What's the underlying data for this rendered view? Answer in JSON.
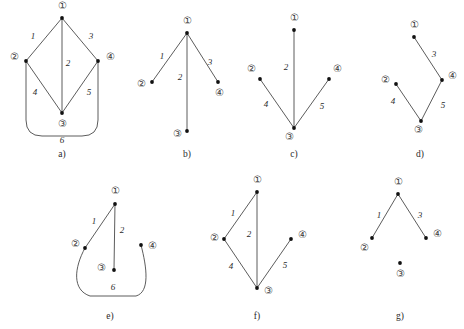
{
  "figure": {
    "width": 464,
    "height": 329,
    "background_color": "#ffffff",
    "edge_color": "#4a4a4a",
    "vertex_color": "#111111",
    "vertex_ring_color": "#7a7a7a",
    "text_color": "#2b2b2b"
  },
  "panels": [
    {
      "id": "a",
      "caption": "a)",
      "caption_pos": {
        "x": 62,
        "y": 155
      },
      "vertices": [
        {
          "label": "①",
          "name": "vertex-1",
          "dot": {
            "x": 62,
            "y": 18
          },
          "label_pos": {
            "x": 62,
            "y": 7
          }
        },
        {
          "label": "②",
          "name": "vertex-2",
          "dot": {
            "x": 26,
            "y": 61
          },
          "label_pos": {
            "x": 14,
            "y": 58
          }
        },
        {
          "label": "③",
          "name": "vertex-3",
          "dot": {
            "x": 62,
            "y": 113
          },
          "label_pos": {
            "x": 62,
            "y": 125
          }
        },
        {
          "label": "④",
          "name": "vertex-4",
          "dot": {
            "x": 98,
            "y": 61
          },
          "label_pos": {
            "x": 110,
            "y": 58
          }
        }
      ],
      "edges": [
        {
          "weight": "1",
          "name": "edge-1-2",
          "from": {
            "x": 62,
            "y": 18
          },
          "to": {
            "x": 26,
            "y": 61
          },
          "label_pos": {
            "x": 33,
            "y": 37
          }
        },
        {
          "weight": "2",
          "name": "edge-1-3",
          "from": {
            "x": 62,
            "y": 18
          },
          "to": {
            "x": 62,
            "y": 113
          },
          "label_pos": {
            "x": 68,
            "y": 64
          }
        },
        {
          "weight": "3",
          "name": "edge-1-4",
          "from": {
            "x": 62,
            "y": 18
          },
          "to": {
            "x": 98,
            "y": 61
          },
          "label_pos": {
            "x": 91,
            "y": 37
          }
        },
        {
          "weight": "4",
          "name": "edge-2-3",
          "from": {
            "x": 26,
            "y": 61
          },
          "to": {
            "x": 62,
            "y": 113
          },
          "label_pos": {
            "x": 35,
            "y": 93
          }
        },
        {
          "weight": "5",
          "name": "edge-3-4",
          "from": {
            "x": 62,
            "y": 113
          },
          "to": {
            "x": 98,
            "y": 61
          },
          "label_pos": {
            "x": 89,
            "y": 93
          }
        },
        {
          "weight": "6",
          "name": "edge-2-4-curved",
          "curve": "M 26 61 L 26 120 Q 26 136 42 136 L 82 136 Q 98 136 98 120 L 98 61",
          "label_pos": {
            "x": 62,
            "y": 141
          }
        }
      ]
    },
    {
      "id": "b",
      "caption": "b)",
      "caption_pos": {
        "x": 187,
        "y": 155
      },
      "vertices": [
        {
          "label": "①",
          "name": "vertex-1",
          "dot": {
            "x": 187,
            "y": 33
          },
          "label_pos": {
            "x": 187,
            "y": 22
          }
        },
        {
          "label": "②",
          "name": "vertex-2",
          "dot": {
            "x": 152,
            "y": 82
          },
          "label_pos": {
            "x": 141,
            "y": 85
          }
        },
        {
          "label": "③",
          "name": "vertex-3",
          "dot": {
            "x": 187,
            "y": 131
          },
          "label_pos": {
            "x": 177,
            "y": 135
          }
        },
        {
          "label": "④",
          "name": "vertex-4",
          "dot": {
            "x": 218,
            "y": 82
          },
          "label_pos": {
            "x": 219,
            "y": 94
          }
        }
      ],
      "edges": [
        {
          "weight": "1",
          "name": "edge-1-2",
          "from": {
            "x": 187,
            "y": 33
          },
          "to": {
            "x": 152,
            "y": 82
          },
          "label_pos": {
            "x": 162,
            "y": 57
          }
        },
        {
          "weight": "2",
          "name": "edge-1-3",
          "from": {
            "x": 187,
            "y": 33
          },
          "to": {
            "x": 187,
            "y": 131
          },
          "label_pos": {
            "x": 180,
            "y": 78
          }
        },
        {
          "weight": "3",
          "name": "edge-1-4",
          "from": {
            "x": 187,
            "y": 33
          },
          "to": {
            "x": 218,
            "y": 82
          },
          "label_pos": {
            "x": 210,
            "y": 63
          }
        }
      ]
    },
    {
      "id": "c",
      "caption": "c)",
      "caption_pos": {
        "x": 294,
        "y": 155
      },
      "vertices": [
        {
          "label": "①",
          "name": "vertex-1",
          "dot": {
            "x": 294,
            "y": 30
          },
          "label_pos": {
            "x": 294,
            "y": 19
          }
        },
        {
          "label": "②",
          "name": "vertex-2",
          "dot": {
            "x": 260,
            "y": 79
          },
          "label_pos": {
            "x": 251,
            "y": 70
          }
        },
        {
          "label": "③",
          "name": "vertex-3",
          "dot": {
            "x": 294,
            "y": 128
          },
          "label_pos": {
            "x": 289,
            "y": 138
          }
        },
        {
          "label": "④",
          "name": "vertex-4",
          "dot": {
            "x": 329,
            "y": 79
          },
          "label_pos": {
            "x": 337,
            "y": 70
          }
        }
      ],
      "edges": [
        {
          "weight": "2",
          "name": "edge-1-3",
          "from": {
            "x": 294,
            "y": 30
          },
          "to": {
            "x": 294,
            "y": 128
          },
          "label_pos": {
            "x": 286,
            "y": 68
          }
        },
        {
          "weight": "4",
          "name": "edge-2-3",
          "from": {
            "x": 260,
            "y": 79
          },
          "to": {
            "x": 294,
            "y": 128
          },
          "label_pos": {
            "x": 266,
            "y": 105
          }
        },
        {
          "weight": "5",
          "name": "edge-3-4",
          "from": {
            "x": 294,
            "y": 128
          },
          "to": {
            "x": 329,
            "y": 79
          },
          "label_pos": {
            "x": 322,
            "y": 107
          }
        }
      ]
    },
    {
      "id": "d",
      "caption": "d)",
      "caption_pos": {
        "x": 420,
        "y": 155
      },
      "vertices": [
        {
          "label": "①",
          "name": "vertex-1",
          "dot": {
            "x": 414,
            "y": 37
          },
          "label_pos": {
            "x": 414,
            "y": 26
          }
        },
        {
          "label": "②",
          "name": "vertex-2",
          "dot": {
            "x": 396,
            "y": 84
          },
          "label_pos": {
            "x": 385,
            "y": 81
          }
        },
        {
          "label": "③",
          "name": "vertex-3",
          "dot": {
            "x": 421,
            "y": 121
          },
          "label_pos": {
            "x": 418,
            "y": 131
          }
        },
        {
          "label": "④",
          "name": "vertex-4",
          "dot": {
            "x": 442,
            "y": 80
          },
          "label_pos": {
            "x": 452,
            "y": 77
          }
        }
      ],
      "edges": [
        {
          "weight": "3",
          "name": "edge-1-4",
          "from": {
            "x": 414,
            "y": 37
          },
          "to": {
            "x": 442,
            "y": 80
          },
          "label_pos": {
            "x": 434,
            "y": 55
          }
        },
        {
          "weight": "4",
          "name": "edge-2-3",
          "from": {
            "x": 396,
            "y": 84
          },
          "to": {
            "x": 421,
            "y": 121
          },
          "label_pos": {
            "x": 393,
            "y": 102
          }
        },
        {
          "weight": "5",
          "name": "edge-3-4",
          "from": {
            "x": 421,
            "y": 121
          },
          "to": {
            "x": 442,
            "y": 80
          },
          "label_pos": {
            "x": 443,
            "y": 106
          }
        }
      ]
    },
    {
      "id": "e",
      "caption": "e)",
      "caption_pos": {
        "x": 110,
        "y": 317
      },
      "vertices": [
        {
          "label": "①",
          "name": "vertex-1",
          "dot": {
            "x": 115,
            "y": 204
          },
          "label_pos": {
            "x": 115,
            "y": 192
          }
        },
        {
          "label": "②",
          "name": "vertex-2",
          "dot": {
            "x": 85,
            "y": 248
          },
          "label_pos": {
            "x": 75,
            "y": 245
          }
        },
        {
          "label": "③",
          "name": "vertex-3",
          "dot": {
            "x": 114,
            "y": 270
          },
          "label_pos": {
            "x": 101,
            "y": 269
          }
        },
        {
          "label": "④",
          "name": "vertex-4",
          "dot": {
            "x": 141,
            "y": 245
          },
          "label_pos": {
            "x": 152,
            "y": 247
          }
        }
      ],
      "edges": [
        {
          "weight": "1",
          "name": "edge-1-2",
          "from": {
            "x": 115,
            "y": 204
          },
          "to": {
            "x": 85,
            "y": 248
          },
          "label_pos": {
            "x": 94,
            "y": 222
          }
        },
        {
          "weight": "2",
          "name": "edge-1-3",
          "from": {
            "x": 115,
            "y": 204
          },
          "to": {
            "x": 114,
            "y": 270
          },
          "label_pos": {
            "x": 122,
            "y": 231
          }
        },
        {
          "weight": "6",
          "name": "edge-2-4-curved",
          "curve": "M 85 248 C 74 268 72 290 90 296 L 136 296 C 150 292 147 268 141 245",
          "label_pos": {
            "x": 113,
            "y": 288
          }
        }
      ]
    },
    {
      "id": "f",
      "caption": "f)",
      "caption_pos": {
        "x": 257,
        "y": 317
      },
      "vertices": [
        {
          "label": "①",
          "name": "vertex-1",
          "dot": {
            "x": 257,
            "y": 192
          },
          "label_pos": {
            "x": 257,
            "y": 181
          }
        },
        {
          "label": "②",
          "name": "vertex-2",
          "dot": {
            "x": 224,
            "y": 239
          },
          "label_pos": {
            "x": 214,
            "y": 239
          }
        },
        {
          "label": "③",
          "name": "vertex-3",
          "dot": {
            "x": 257,
            "y": 288
          },
          "label_pos": {
            "x": 268,
            "y": 292
          }
        },
        {
          "label": "④",
          "name": "vertex-4",
          "dot": {
            "x": 291,
            "y": 239
          },
          "label_pos": {
            "x": 302,
            "y": 236
          }
        }
      ],
      "edges": [
        {
          "weight": "1",
          "name": "edge-1-2",
          "from": {
            "x": 257,
            "y": 192
          },
          "to": {
            "x": 224,
            "y": 239
          },
          "label_pos": {
            "x": 233,
            "y": 214
          }
        },
        {
          "weight": "2",
          "name": "edge-1-3",
          "from": {
            "x": 257,
            "y": 192
          },
          "to": {
            "x": 257,
            "y": 288
          },
          "label_pos": {
            "x": 249,
            "y": 235
          }
        },
        {
          "weight": "4",
          "name": "edge-2-3",
          "from": {
            "x": 224,
            "y": 239
          },
          "to": {
            "x": 257,
            "y": 288
          },
          "label_pos": {
            "x": 231,
            "y": 267
          }
        },
        {
          "weight": "5",
          "name": "edge-3-4",
          "from": {
            "x": 257,
            "y": 288
          },
          "to": {
            "x": 291,
            "y": 239
          },
          "label_pos": {
            "x": 285,
            "y": 266
          }
        }
      ]
    },
    {
      "id": "g",
      "caption": "g)",
      "caption_pos": {
        "x": 400,
        "y": 317
      },
      "vertices": [
        {
          "label": "①",
          "name": "vertex-1",
          "dot": {
            "x": 398,
            "y": 194
          },
          "label_pos": {
            "x": 398,
            "y": 183
          }
        },
        {
          "label": "②",
          "name": "vertex-2",
          "dot": {
            "x": 372,
            "y": 238
          },
          "label_pos": {
            "x": 364,
            "y": 249
          }
        },
        {
          "label": "③",
          "name": "vertex-3",
          "dot": {
            "x": 400,
            "y": 263
          },
          "label_pos": {
            "x": 400,
            "y": 275
          }
        },
        {
          "label": "④",
          "name": "vertex-4",
          "dot": {
            "x": 426,
            "y": 238
          },
          "label_pos": {
            "x": 437,
            "y": 235
          }
        }
      ],
      "edges": [
        {
          "weight": "1",
          "name": "edge-1-2",
          "from": {
            "x": 398,
            "y": 194
          },
          "to": {
            "x": 372,
            "y": 238
          },
          "label_pos": {
            "x": 379,
            "y": 216
          }
        },
        {
          "weight": "3",
          "name": "edge-1-4",
          "from": {
            "x": 398,
            "y": 194
          },
          "to": {
            "x": 426,
            "y": 238
          },
          "label_pos": {
            "x": 420,
            "y": 216
          }
        }
      ]
    }
  ]
}
